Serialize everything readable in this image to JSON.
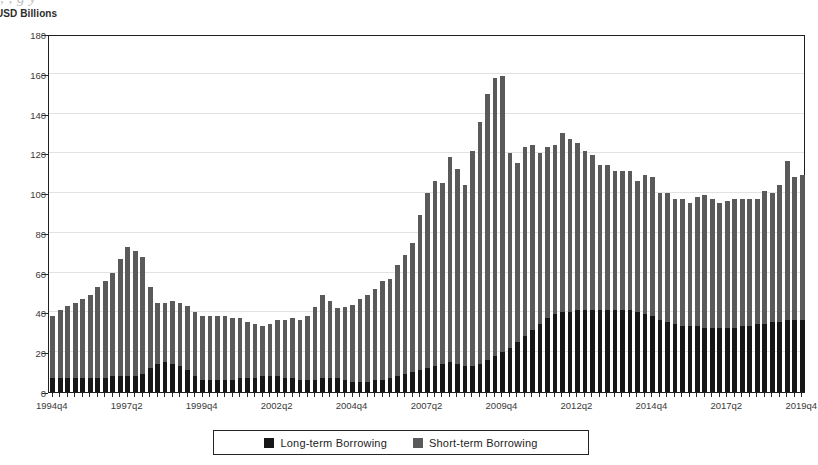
{
  "top_artifact_text": ", , g y",
  "axis_title": "USD Billions",
  "legend": {
    "items": [
      {
        "label": "Long-term Borrowing",
        "color": "#171717",
        "key": "long"
      },
      {
        "label": "Short-term Borrowing",
        "color": "#5a5a5a",
        "key": "short"
      }
    ]
  },
  "chart_data": {
    "type": "bar",
    "stacked": true,
    "title": "",
    "subtitle": "",
    "xlabel": "",
    "ylabel": "USD Billions",
    "ylim": [
      0,
      180
    ],
    "ytick_step": 20,
    "yticks": [
      0,
      20,
      40,
      60,
      80,
      100,
      120,
      140,
      160,
      180
    ],
    "grid": true,
    "grid_axis": "y",
    "legend_position": "bottom",
    "xtick_labels": [
      "1994q4",
      "1997q2",
      "1999q4",
      "2002q2",
      "2004q4",
      "2007q2",
      "2009q4",
      "2012q2",
      "2014q4",
      "2017q2",
      "2019q4"
    ],
    "xtick_every": 10,
    "categories": [
      "1994q4",
      "1995q1",
      "1995q2",
      "1995q3",
      "1995q4",
      "1996q1",
      "1996q2",
      "1996q3",
      "1996q4",
      "1997q1",
      "1997q2",
      "1997q3",
      "1997q4",
      "1998q1",
      "1998q2",
      "1998q3",
      "1998q4",
      "1999q1",
      "1999q2",
      "1999q3",
      "1999q4",
      "2000q1",
      "2000q2",
      "2000q3",
      "2000q4",
      "2001q1",
      "2001q2",
      "2001q3",
      "2001q4",
      "2002q1",
      "2002q2",
      "2002q3",
      "2002q4",
      "2003q1",
      "2003q2",
      "2003q3",
      "2003q4",
      "2004q1",
      "2004q2",
      "2004q3",
      "2004q4",
      "2005q1",
      "2005q2",
      "2005q3",
      "2005q4",
      "2006q1",
      "2006q2",
      "2006q3",
      "2006q4",
      "2007q1",
      "2007q2",
      "2007q3",
      "2007q4",
      "2008q1",
      "2008q2",
      "2008q3",
      "2008q4",
      "2009q1",
      "2009q2",
      "2009q3",
      "2009q4",
      "2010q1",
      "2010q2",
      "2010q3",
      "2010q4",
      "2011q1",
      "2011q2",
      "2011q3",
      "2011q4",
      "2012q1",
      "2012q2",
      "2012q3",
      "2012q4",
      "2013q1",
      "2013q2",
      "2013q3",
      "2013q4",
      "2014q1",
      "2014q2",
      "2014q3",
      "2014q4",
      "2015q1",
      "2015q2",
      "2015q3",
      "2015q4",
      "2016q1",
      "2016q2",
      "2016q3",
      "2016q4",
      "2017q1",
      "2017q2",
      "2017q3",
      "2017q4",
      "2018q1",
      "2018q2",
      "2018q3",
      "2018q4",
      "2019q1",
      "2019q2",
      "2019q3",
      "2019q4"
    ],
    "series": [
      {
        "name": "Long-term Borrowing",
        "color": "#171717",
        "values": [
          7,
          7,
          7,
          7,
          7,
          7,
          7,
          7,
          8,
          8,
          8,
          8,
          9,
          12,
          14,
          15,
          14,
          13,
          11,
          8,
          6,
          6,
          6,
          6,
          6,
          7,
          7,
          7,
          8,
          8,
          8,
          7,
          7,
          6,
          6,
          6,
          7,
          7,
          7,
          6,
          5,
          5,
          5,
          6,
          6,
          7,
          8,
          9,
          10,
          11,
          12,
          13,
          14,
          15,
          14,
          13,
          13,
          14,
          16,
          18,
          20,
          22,
          25,
          28,
          31,
          34,
          37,
          39,
          40,
          40,
          41,
          41,
          41,
          41,
          41,
          41,
          41,
          41,
          40,
          39,
          38,
          36,
          35,
          34,
          33,
          33,
          33,
          32,
          32,
          32,
          32,
          32,
          33,
          33,
          34,
          34,
          35,
          35,
          36,
          36,
          36
        ]
      },
      {
        "name": "Short-term Borrowing",
        "color": "#5a5a5a",
        "values": [
          31,
          34,
          36,
          38,
          40,
          42,
          46,
          49,
          52,
          59,
          65,
          63,
          59,
          41,
          31,
          30,
          32,
          32,
          32,
          32,
          32,
          32,
          32,
          32,
          31,
          30,
          28,
          27,
          25,
          26,
          28,
          29,
          30,
          30,
          32,
          37,
          42,
          39,
          35,
          37,
          39,
          42,
          44,
          46,
          50,
          50,
          56,
          60,
          65,
          78,
          88,
          93,
          91,
          103,
          98,
          91,
          108,
          122,
          134,
          140,
          139,
          98,
          90,
          95,
          93,
          86,
          86,
          85,
          90,
          87,
          84,
          80,
          78,
          73,
          73,
          70,
          70,
          70,
          66,
          70,
          70,
          64,
          65,
          63,
          64,
          62,
          65,
          67,
          65,
          63,
          64,
          65,
          64,
          64,
          63,
          67,
          65,
          69,
          80,
          72,
          73
        ]
      }
    ]
  }
}
